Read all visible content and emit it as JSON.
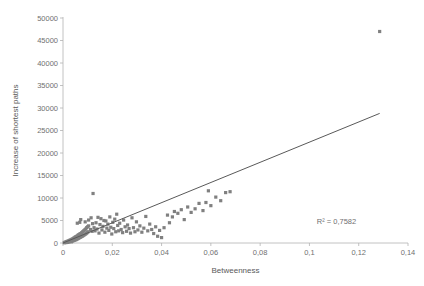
{
  "chart_data": {
    "type": "scatter",
    "title": "",
    "xlabel": "Betweenness",
    "ylabel": "Increase of shortest paths",
    "xlim": [
      0,
      0.14
    ],
    "ylim": [
      0,
      50000
    ],
    "xticks": [
      "0",
      "0,02",
      "0,04",
      "0,06",
      "0,08",
      "0,1",
      "0,12",
      "0,14"
    ],
    "xtick_values": [
      0,
      0.02,
      0.04,
      0.06,
      0.08,
      0.1,
      0.12,
      0.14
    ],
    "yticks": [
      "0",
      "5000",
      "10000",
      "15000",
      "20000",
      "25000",
      "30000",
      "35000",
      "40000",
      "45000",
      "50000"
    ],
    "ytick_values": [
      0,
      5000,
      10000,
      15000,
      20000,
      25000,
      30000,
      35000,
      40000,
      45000,
      50000
    ],
    "grid": false,
    "legend": null,
    "marker_color": "#808080",
    "trendline_color": "#595959",
    "annotations": [
      {
        "text": "R² = 0,7582",
        "x": 0.103,
        "y": 4200
      }
    ],
    "trendline": {
      "x0": 0.0,
      "y0": 0,
      "x1": 0.1285,
      "y1": 28800
    },
    "points": [
      [
        0.0005,
        60
      ],
      [
        0.0008,
        120
      ],
      [
        0.001,
        200
      ],
      [
        0.0012,
        90
      ],
      [
        0.0014,
        260
      ],
      [
        0.0016,
        330
      ],
      [
        0.0018,
        150
      ],
      [
        0.002,
        420
      ],
      [
        0.0022,
        210
      ],
      [
        0.0024,
        500
      ],
      [
        0.0026,
        300
      ],
      [
        0.0028,
        620
      ],
      [
        0.003,
        380
      ],
      [
        0.0032,
        700
      ],
      [
        0.0034,
        260
      ],
      [
        0.0036,
        820
      ],
      [
        0.0038,
        440
      ],
      [
        0.004,
        950
      ],
      [
        0.0042,
        520
      ],
      [
        0.0044,
        1100
      ],
      [
        0.0046,
        610
      ],
      [
        0.0048,
        1250
      ],
      [
        0.005,
        700
      ],
      [
        0.0052,
        1400
      ],
      [
        0.0054,
        760
      ],
      [
        0.0056,
        1500
      ],
      [
        0.0058,
        900
      ],
      [
        0.006,
        1700
      ],
      [
        0.0062,
        1000
      ],
      [
        0.0064,
        1850
      ],
      [
        0.0066,
        1150
      ],
      [
        0.0068,
        2000
      ],
      [
        0.007,
        1250
      ],
      [
        0.0072,
        2100
      ],
      [
        0.0074,
        1400
      ],
      [
        0.0076,
        2300
      ],
      [
        0.0078,
        1500
      ],
      [
        0.008,
        2500
      ],
      [
        0.0082,
        1650
      ],
      [
        0.0084,
        2700
      ],
      [
        0.0086,
        1800
      ],
      [
        0.0088,
        2900
      ],
      [
        0.009,
        1950
      ],
      [
        0.0092,
        3100
      ],
      [
        0.0094,
        2100
      ],
      [
        0.0096,
        3400
      ],
      [
        0.0098,
        2300
      ],
      [
        0.01,
        3600
      ],
      [
        0.0102,
        2500
      ],
      [
        0.0104,
        3800
      ],
      [
        0.0058,
        4400
      ],
      [
        0.0068,
        4600
      ],
      [
        0.0072,
        5200
      ],
      [
        0.009,
        4700
      ],
      [
        0.0104,
        5100
      ],
      [
        0.0112,
        3000
      ],
      [
        0.0114,
        5600
      ],
      [
        0.0118,
        2600
      ],
      [
        0.012,
        4300
      ],
      [
        0.0122,
        11000
      ],
      [
        0.0126,
        3400
      ],
      [
        0.013,
        2700
      ],
      [
        0.0134,
        4500
      ],
      [
        0.0138,
        3100
      ],
      [
        0.0142,
        5700
      ],
      [
        0.0146,
        2200
      ],
      [
        0.015,
        4100
      ],
      [
        0.0154,
        5400
      ],
      [
        0.0158,
        2900
      ],
      [
        0.0162,
        3700
      ],
      [
        0.0166,
        5000
      ],
      [
        0.017,
        2400
      ],
      [
        0.0174,
        4900
      ],
      [
        0.0178,
        3300
      ],
      [
        0.0182,
        4200
      ],
      [
        0.0186,
        2800
      ],
      [
        0.019,
        5800
      ],
      [
        0.0194,
        3500
      ],
      [
        0.0198,
        2000
      ],
      [
        0.0202,
        4600
      ],
      [
        0.0206,
        3200
      ],
      [
        0.021,
        5300
      ],
      [
        0.0214,
        2500
      ],
      [
        0.0218,
        6400
      ],
      [
        0.0222,
        3900
      ],
      [
        0.0226,
        2700
      ],
      [
        0.023,
        4400
      ],
      [
        0.0236,
        3000
      ],
      [
        0.0242,
        2300
      ],
      [
        0.0246,
        5100
      ],
      [
        0.0252,
        3600
      ],
      [
        0.0258,
        2600
      ],
      [
        0.0262,
        4000
      ],
      [
        0.0268,
        3200
      ],
      [
        0.0274,
        2200
      ],
      [
        0.028,
        5600
      ],
      [
        0.0286,
        3400
      ],
      [
        0.0292,
        2500
      ],
      [
        0.0298,
        4700
      ],
      [
        0.0304,
        2900
      ],
      [
        0.0312,
        3800
      ],
      [
        0.032,
        2400
      ],
      [
        0.0328,
        3300
      ],
      [
        0.0336,
        5900
      ],
      [
        0.0344,
        2700
      ],
      [
        0.0352,
        4200
      ],
      [
        0.036,
        3000
      ],
      [
        0.0368,
        2100
      ],
      [
        0.0376,
        3600
      ],
      [
        0.0384,
        1500
      ],
      [
        0.0392,
        2800
      ],
      [
        0.04,
        1200
      ],
      [
        0.041,
        3400
      ],
      [
        0.0424,
        6200
      ],
      [
        0.0432,
        4500
      ],
      [
        0.0444,
        5800
      ],
      [
        0.0452,
        7000
      ],
      [
        0.0466,
        6600
      ],
      [
        0.048,
        7400
      ],
      [
        0.0492,
        5200
      ],
      [
        0.0506,
        8000
      ],
      [
        0.052,
        6800
      ],
      [
        0.0536,
        7600
      ],
      [
        0.0552,
        8800
      ],
      [
        0.0568,
        7200
      ],
      [
        0.058,
        9000
      ],
      [
        0.059,
        11600
      ],
      [
        0.06,
        8300
      ],
      [
        0.062,
        10200
      ],
      [
        0.064,
        9400
      ],
      [
        0.066,
        11200
      ],
      [
        0.0678,
        11400
      ],
      [
        0.1285,
        47000
      ]
    ]
  }
}
